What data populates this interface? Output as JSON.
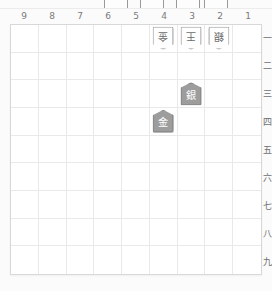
{
  "app": {
    "title": "Shogi Board",
    "board_size": 9
  },
  "colors": {
    "board_background": "#ffffff",
    "page_background": "#fbfbfb",
    "grid_line": "#e9e9e9",
    "board_border": "#d8d8d8",
    "label_text": "#7a7a7a",
    "gote_piece_fill": "#fefefe",
    "gote_piece_border": "#8f8f8f",
    "gote_piece_text": "#6b6b6b",
    "sente_piece_fill": "#9d9d9d",
    "sente_piece_border": "#7b7b7b",
    "sente_piece_text": "#ffffff"
  },
  "board": {
    "column_labels": [
      "9",
      "8",
      "7",
      "6",
      "5",
      "4",
      "3",
      "2",
      "1"
    ],
    "row_labels": [
      "一",
      "二",
      "三",
      "四",
      "五",
      "六",
      "七",
      "八",
      "九"
    ],
    "pieces": [
      {
        "id": "p1",
        "glyph": "金",
        "name": "gold-general",
        "side": "gote",
        "file": "4",
        "rank": "一",
        "col_index": 5,
        "row_index": 0
      },
      {
        "id": "p2",
        "glyph": "王",
        "name": "king",
        "side": "gote",
        "file": "3",
        "rank": "一",
        "col_index": 6,
        "row_index": 0
      },
      {
        "id": "p3",
        "glyph": "銀",
        "name": "silver-general",
        "side": "gote",
        "file": "2",
        "rank": "一",
        "col_index": 7,
        "row_index": 0
      },
      {
        "id": "p4",
        "glyph": "銀",
        "name": "silver-general",
        "side": "sente",
        "file": "3",
        "rank": "三",
        "col_index": 6,
        "row_index": 2
      },
      {
        "id": "p5",
        "glyph": "金",
        "name": "gold-general",
        "side": "sente",
        "file": "4",
        "rank": "四",
        "col_index": 5,
        "row_index": 3
      }
    ]
  },
  "hand": {
    "label": "captured-pieces",
    "count": 4,
    "pieces": [
      "",
      "",
      "",
      ""
    ]
  }
}
